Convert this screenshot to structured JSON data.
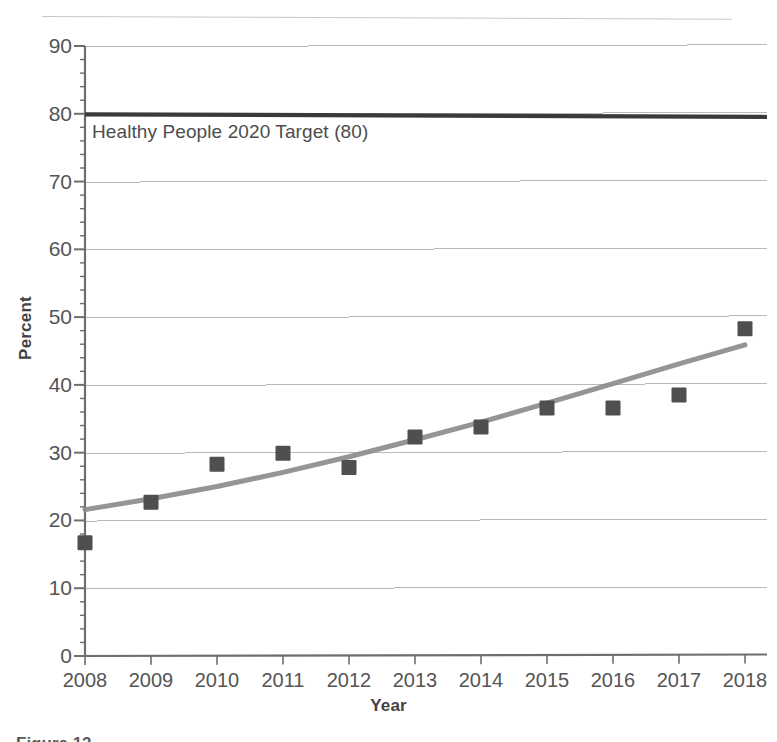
{
  "chart_data": {
    "type": "scatter",
    "title": "",
    "xlabel": "Year",
    "ylabel": "Percent",
    "categories": [
      "2008",
      "2009",
      "2010",
      "2011",
      "2012",
      "2013",
      "2014",
      "2015",
      "2016",
      "2017",
      "2018"
    ],
    "x": [
      2008,
      2009,
      2010,
      2011,
      2012,
      2013,
      2014,
      2015,
      2016,
      2017,
      2018
    ],
    "values": [
      16.7,
      22.7,
      28.3,
      29.9,
      27.8,
      32.3,
      33.8,
      36.6,
      36.6,
      38.5,
      48.3
    ],
    "series": [
      {
        "name": "Percent",
        "marker": "square",
        "values": [
          16.7,
          22.7,
          28.3,
          29.9,
          27.8,
          32.3,
          33.8,
          36.6,
          36.6,
          38.5,
          48.3
        ]
      },
      {
        "name": "Trend line",
        "type": "line",
        "values": [
          21.6,
          23.2,
          25.0,
          27.1,
          29.4,
          31.9,
          34.5,
          37.3,
          40.2,
          43.1,
          45.9
        ]
      }
    ],
    "reference_lines": [
      {
        "label": "Healthy People 2020 Target (80)",
        "value": 80,
        "orientation": "horizontal"
      }
    ],
    "xlim": [
      2008,
      2018
    ],
    "ylim": [
      0,
      90
    ],
    "y_ticks": [
      "0",
      "10",
      "20",
      "30",
      "40",
      "50",
      "60",
      "70",
      "80",
      "90"
    ],
    "y_tick_values": [
      0,
      10,
      20,
      30,
      40,
      50,
      60,
      70,
      80,
      90
    ],
    "y_minor_tick_step": 2,
    "x_ticks": [
      "2008",
      "2009",
      "2010",
      "2011",
      "2012",
      "2013",
      "2014",
      "2015",
      "2016",
      "2017",
      "2018"
    ],
    "grid": "horizontal",
    "legend": "none",
    "colors": {
      "marker": "#4f4f4f",
      "trend_line": "#8c8c8c",
      "target_line": "#3a3a3a",
      "gridline": "#b9b9b9",
      "axis": "#6e6e6e",
      "text": "#555555",
      "background": "#ffffff"
    }
  },
  "annotations": {
    "target_label": "Healthy People 2020 Target (80)"
  },
  "axes": {
    "y_title": "Percent",
    "x_title": "Year"
  },
  "caption": {
    "text": "Figure 12."
  }
}
